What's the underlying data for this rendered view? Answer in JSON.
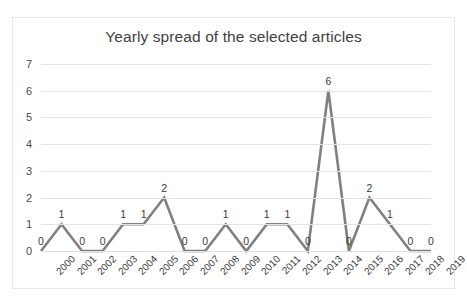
{
  "chart_data": {
    "type": "line",
    "title": "Yearly spread of the selected articles",
    "xlabel": "",
    "ylabel": "",
    "categories": [
      "2000",
      "2001",
      "2002",
      "2003",
      "2004",
      "2005",
      "2006",
      "2007",
      "2008",
      "2009",
      "2010",
      "2011",
      "2012",
      "2013",
      "2014",
      "2015",
      "2016",
      "2017",
      "2018",
      "2019"
    ],
    "values": [
      0,
      1,
      0,
      0,
      1,
      1,
      2,
      0,
      0,
      1,
      0,
      1,
      1,
      0,
      6,
      0,
      2,
      1,
      0,
      0
    ],
    "data_labels": [
      "0",
      "1",
      "0",
      "0",
      "1",
      "1",
      "2",
      "0",
      "0",
      "1",
      "0",
      "1",
      "1",
      "0",
      "6",
      "0",
      "2",
      "1",
      "0",
      "0"
    ],
    "ylim": [
      0,
      7
    ],
    "yticks": [
      0,
      1,
      2,
      3,
      4,
      5,
      6,
      7
    ],
    "ytick_labels": [
      "0",
      "1",
      "2",
      "3",
      "4",
      "5",
      "6",
      "7"
    ],
    "grid": "horizontal",
    "legend": "none",
    "series": [
      {
        "name": "Articles per year",
        "values": [
          0,
          1,
          0,
          0,
          1,
          1,
          2,
          0,
          0,
          1,
          0,
          1,
          1,
          0,
          6,
          0,
          2,
          1,
          0,
          0
        ],
        "color": "#808080"
      }
    ],
    "colors": {
      "line": "#808080",
      "gridline": "#e4e4e4",
      "text": "#3a3a3a",
      "title": "#3f3f3f",
      "border": "#e8e8e8",
      "background": "#ffffff"
    }
  }
}
